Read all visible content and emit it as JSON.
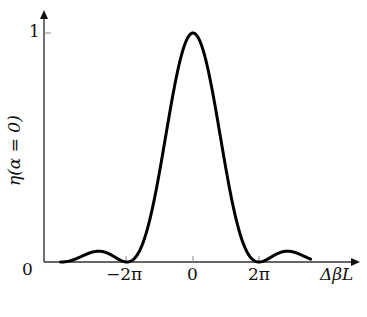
{
  "chart_data": {
    "type": "line",
    "title": "",
    "xlabel": "ΔβL",
    "ylabel": "η(α = 0)",
    "x_ticks": [
      {
        "label": "−2π",
        "value": -6.2832
      },
      {
        "label": "0",
        "value": 0
      },
      {
        "label": "2π",
        "value": 6.2832
      }
    ],
    "y_ticks": [
      {
        "label": "0",
        "value": 0
      },
      {
        "label": "1",
        "value": 1
      }
    ],
    "xlim": [
      -12.6,
      11.2
    ],
    "ylim": [
      0,
      1.15
    ],
    "grid": false,
    "legend": null,
    "series": [
      {
        "name": "η(α=0)",
        "function": "sinc^2(ΔβL/2)",
        "x": [
          -12.6,
          -11,
          -9.42,
          -8,
          -6.2832,
          -4,
          -2,
          0,
          2,
          4,
          6.2832,
          8,
          9.42,
          11
        ],
        "y": [
          0.0,
          0.01,
          0.045,
          0.02,
          0.0,
          0.21,
          0.71,
          1.0,
          0.71,
          0.21,
          0.0,
          0.02,
          0.045,
          0.01
        ]
      }
    ]
  },
  "axes": {
    "x_axis_label": "ΔβL",
    "y_axis_label": "η(α = 0)",
    "origin_label": "0",
    "y_max_label": "1",
    "x_tick_labels": [
      "−2π",
      "0",
      "2π"
    ]
  }
}
